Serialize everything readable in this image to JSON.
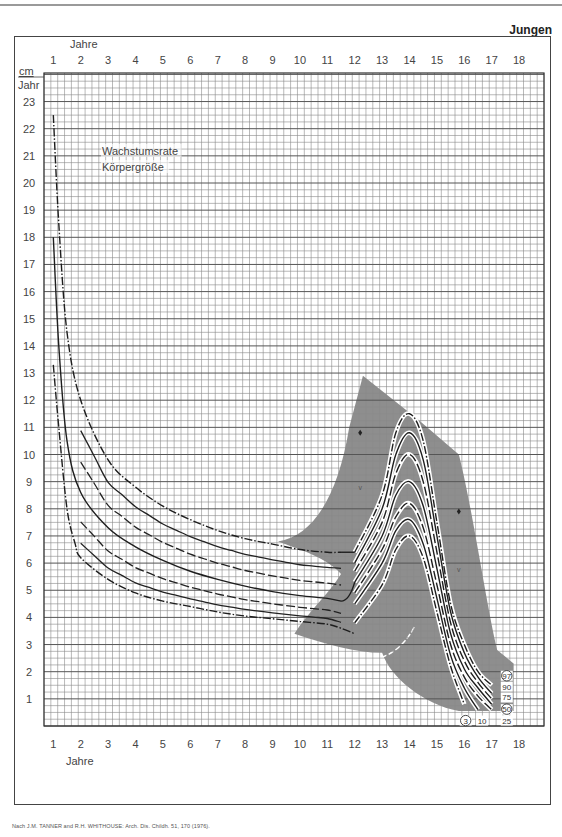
{
  "header": {
    "label": "Jungen"
  },
  "footer": {
    "source": "Nach J.M. TANNER and R.H. WHITHOUSE: Arch. Dis. Childh. 51, 170 (1976)."
  },
  "chart_data": {
    "type": "line",
    "title_lines": [
      "Wachstumsrate",
      "Körpergröße"
    ],
    "group": "Jungen",
    "xlabel": "Jahre",
    "ylabel_top": "cm",
    "ylabel_bottom": "Jahr",
    "x_ticks": [
      1,
      2,
      3,
      4,
      5,
      6,
      7,
      8,
      9,
      10,
      11,
      12,
      13,
      14,
      15,
      16,
      17,
      18
    ],
    "y_ticks": [
      1,
      2,
      3,
      4,
      5,
      6,
      7,
      8,
      9,
      10,
      11,
      12,
      13,
      14,
      15,
      16,
      17,
      18,
      19,
      20,
      21,
      22,
      23
    ],
    "xlim": [
      0.7,
      18.3
    ],
    "ylim": [
      0,
      24
    ],
    "grid": true,
    "legend": {
      "percentiles": [
        "3",
        "10",
        "25",
        "50",
        "75",
        "90",
        "97"
      ],
      "circled": [
        "3",
        "50",
        "97"
      ],
      "position": "bottom-right"
    },
    "series": [
      {
        "name": "3. Perzentile (pre-puberty, 1-2y start)",
        "style": "dash-dot",
        "x": [
          1.0,
          1.2,
          1.5,
          1.8,
          2.0,
          3,
          4,
          5,
          6,
          7,
          8,
          9,
          10,
          11,
          11.5,
          12
        ],
        "y": [
          13.3,
          11.0,
          8.0,
          6.7,
          6.2,
          5.4,
          4.9,
          4.6,
          4.4,
          4.2,
          4.05,
          3.95,
          3.85,
          3.75,
          3.6,
          3.4
        ]
      },
      {
        "name": "97. Perzentile (pre-puberty)",
        "style": "dash-dot",
        "x": [
          1.0,
          1.2,
          1.5,
          2.0,
          3,
          4,
          5,
          6,
          7,
          8,
          9,
          10,
          11,
          11.5
        ],
        "y": [
          22.5,
          18.5,
          14.5,
          12.0,
          9.8,
          8.8,
          8.1,
          7.6,
          7.2,
          6.9,
          6.7,
          6.5,
          6.4,
          6.4
        ]
      },
      {
        "name": "50. Perzentile (pre-puberty)",
        "style": "solid",
        "x": [
          1.0,
          1.2,
          1.5,
          2.0,
          3,
          4,
          5,
          6,
          7,
          8,
          9,
          10,
          11,
          11.5
        ],
        "y": [
          18.0,
          14.0,
          10.5,
          8.6,
          7.3,
          6.6,
          6.1,
          5.7,
          5.4,
          5.15,
          4.95,
          4.8,
          4.7,
          4.6
        ]
      },
      {
        "name": "Peak 97",
        "style": "dash-dot",
        "x": [
          12,
          13,
          13.5,
          14,
          14.5,
          15,
          15.5,
          16,
          16.5,
          17
        ],
        "y": [
          6.4,
          8.5,
          10.8,
          11.5,
          10.5,
          7.5,
          4.5,
          3.0,
          2.0,
          1.5
        ]
      },
      {
        "name": "Peak 90",
        "style": "solid",
        "x": [
          12,
          13,
          13.5,
          14,
          14.5,
          15,
          15.5,
          16,
          16.5,
          17
        ],
        "y": [
          6.0,
          8.0,
          10.0,
          10.8,
          9.8,
          7.0,
          4.2,
          2.7,
          1.8,
          1.2
        ]
      },
      {
        "name": "Peak 75",
        "style": "dash",
        "x": [
          12,
          13,
          13.5,
          14,
          14.5,
          15,
          15.5,
          16,
          16.5,
          17
        ],
        "y": [
          5.7,
          7.5,
          9.3,
          10.0,
          9.0,
          6.4,
          3.8,
          2.4,
          1.6,
          1.0
        ]
      },
      {
        "name": "Peak 50",
        "style": "solid",
        "x": [
          12,
          13,
          13.5,
          14,
          14.5,
          15,
          15.5,
          16,
          16.5,
          17
        ],
        "y": [
          5.3,
          7.0,
          8.5,
          9.0,
          8.1,
          5.8,
          3.4,
          2.1,
          1.4,
          0.8
        ]
      },
      {
        "name": "Peak 25",
        "style": "dash",
        "x": [
          12,
          13,
          13.5,
          14,
          14.5,
          15,
          15.5,
          16,
          16.5,
          17
        ],
        "y": [
          4.9,
          6.5,
          7.7,
          8.2,
          7.3,
          5.2,
          3.0,
          1.8,
          1.1,
          0.6
        ]
      },
      {
        "name": "Peak 10",
        "style": "solid",
        "x": [
          12,
          13,
          13.5,
          14,
          14.5,
          15,
          15.5,
          16,
          16.5
        ],
        "y": [
          4.5,
          6.0,
          7.2,
          7.6,
          6.7,
          4.7,
          2.6,
          1.4,
          0.6
        ]
      },
      {
        "name": "Peak 3",
        "style": "dash-dot",
        "x": [
          12,
          13,
          13.5,
          14,
          14.5,
          15,
          15.5,
          16
        ],
        "y": [
          3.8,
          5.2,
          6.5,
          7.0,
          6.2,
          4.2,
          2.2,
          0.8
        ]
      }
    ],
    "shaded_region": {
      "description": "grey band of early/late maturers",
      "apex": [
        12.3,
        12.9
      ]
    },
    "markers": [
      {
        "symbol": "diamond",
        "x": 12.2,
        "y": 10.8
      },
      {
        "symbol": "v",
        "x": 12.2,
        "y": 8.8
      },
      {
        "symbol": "diamond",
        "x": 15.8,
        "y": 7.9
      },
      {
        "symbol": "v",
        "x": 15.8,
        "y": 5.8
      }
    ]
  }
}
